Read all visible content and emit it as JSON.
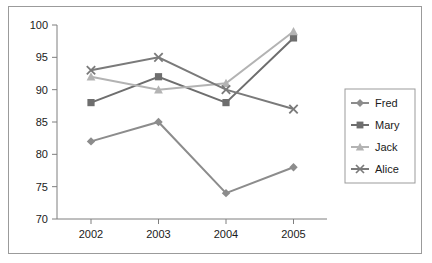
{
  "chart_data": {
    "type": "line",
    "title": "",
    "xlabel": "",
    "ylabel": "",
    "categories": [
      "2002",
      "2003",
      "2004",
      "2005"
    ],
    "ylim": [
      70,
      100
    ],
    "yticks": [
      70,
      75,
      80,
      85,
      90,
      95,
      100
    ],
    "grid": false,
    "legend_position": "right",
    "series": [
      {
        "name": "Fred",
        "color": "#8c8c8c",
        "marker": "diamond",
        "values": [
          82,
          85,
          74,
          78
        ]
      },
      {
        "name": "Mary",
        "color": "#6e6e6e",
        "marker": "square",
        "values": [
          88,
          92,
          88,
          98
        ]
      },
      {
        "name": "Jack",
        "color": "#b3b3b3",
        "marker": "triangle",
        "values": [
          92,
          90,
          91,
          99
        ]
      },
      {
        "name": "Alice",
        "color": "#7a7a7a",
        "marker": "x",
        "values": [
          93,
          95,
          90,
          87
        ]
      }
    ]
  },
  "axis": {
    "y_tick_labels": [
      "100",
      "95",
      "90",
      "85",
      "80",
      "75",
      "70"
    ],
    "x_tick_labels": [
      "2002",
      "2003",
      "2004",
      "2005"
    ]
  },
  "legend": {
    "items": [
      {
        "label": "Fred"
      },
      {
        "label": "Mary"
      },
      {
        "label": "Jack"
      },
      {
        "label": "Alice"
      }
    ]
  }
}
